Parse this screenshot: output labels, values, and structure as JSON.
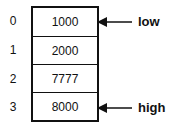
{
  "diagram": {
    "type": "array-with-pointers",
    "cells": [
      {
        "index": "0",
        "value": "1000"
      },
      {
        "index": "1",
        "value": "2000"
      },
      {
        "index": "2",
        "value": "7777"
      },
      {
        "index": "3",
        "value": "8000"
      }
    ],
    "pointers": [
      {
        "label": "low",
        "target_index": "0"
      },
      {
        "label": "high",
        "target_index": "3"
      }
    ]
  }
}
